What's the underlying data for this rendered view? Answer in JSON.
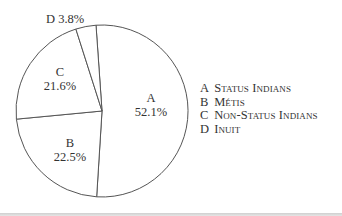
{
  "chart_data": {
    "type": "pie",
    "title": "",
    "start_angle_deg": -4,
    "direction": "clockwise",
    "categories": [
      "A",
      "B",
      "C",
      "D"
    ],
    "values": [
      52.1,
      22.5,
      21.6,
      3.8
    ],
    "value_labels": [
      "52.1%",
      "22.5%",
      "21.6%",
      "3.8%"
    ],
    "legend": [
      {
        "key": "A",
        "label": "Status Indians"
      },
      {
        "key": "B",
        "label": "Métis"
      },
      {
        "key": "C",
        "label": "Non-Status Indians"
      },
      {
        "key": "D",
        "label": "Inuit"
      }
    ],
    "legend_position": "right",
    "fill_color": "#ffffff",
    "stroke_color": "#555555"
  },
  "slices": [
    {
      "key": "A",
      "percent": "52.1%"
    },
    {
      "key": "B",
      "percent": "22.5%"
    },
    {
      "key": "C",
      "percent": "21.6%"
    },
    {
      "key": "D",
      "percent": "3.8%",
      "label_outside": "D 3.8%"
    }
  ],
  "legend": {
    "items": [
      {
        "key": "A",
        "label": "Status Indians"
      },
      {
        "key": "B",
        "label": "Métis"
      },
      {
        "key": "C",
        "label": "Non-Status Indians"
      },
      {
        "key": "D",
        "label": "Inuit"
      }
    ]
  }
}
